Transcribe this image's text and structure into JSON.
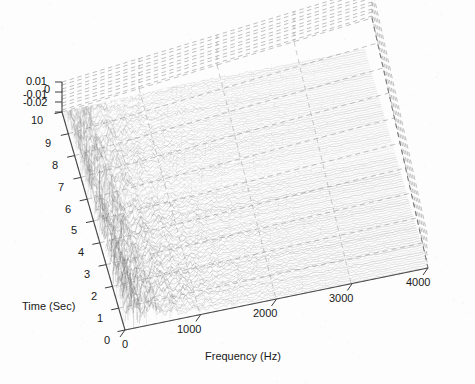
{
  "figure": {
    "type": "3d-waterfall-plot",
    "background": "#fdfdfd",
    "render_style": "scanned-fax-grayscale"
  },
  "axes": {
    "x": {
      "name": "frequency-axis",
      "title": "Frequency (Hz)",
      "ticks": [
        "0",
        "1000",
        "2000",
        "3000",
        "4000"
      ],
      "values": [
        0,
        1000,
        2000,
        3000,
        4000
      ],
      "range": [
        0,
        4000
      ]
    },
    "y": {
      "name": "time-axis",
      "title": "Time (Sec)",
      "ticks": [
        "0",
        "1",
        "2",
        "3",
        "4",
        "5",
        "6",
        "7",
        "8",
        "9",
        "10"
      ],
      "values": [
        0,
        1,
        2,
        3,
        4,
        5,
        6,
        7,
        8,
        9,
        10
      ],
      "range": [
        0,
        10
      ]
    },
    "z": {
      "name": "amplitude-axis",
      "title": "",
      "ticks": [
        "0.01",
        "0",
        "-0.01",
        "-0.02"
      ],
      "values": [
        0.01,
        0,
        -0.01,
        -0.02
      ],
      "range": [
        -0.02,
        0.01
      ]
    }
  },
  "chart_data": {
    "type": "line",
    "title": "",
    "subtitle": "",
    "xlabel": "Frequency (Hz)",
    "ylabel": "Time (Sec)",
    "zlabel": "",
    "xlim": [
      0,
      4000
    ],
    "ylim": [
      0,
      10
    ],
    "zlim": [
      -0.02,
      0.01
    ],
    "xticks": [
      0,
      1000,
      2000,
      3000,
      4000
    ],
    "yticks": [
      0,
      1,
      2,
      3,
      4,
      5,
      6,
      7,
      8,
      9,
      10
    ],
    "zticks": [
      -0.02,
      -0.01,
      0,
      0.01
    ],
    "grid": true,
    "grid_style": "dashed",
    "legend": null,
    "legend_position": "none",
    "projection": "3d-waterfall",
    "view": {
      "azimuth": -37,
      "elevation": 20
    },
    "n_traces": 100,
    "trace_axis": "time",
    "series": [
      {
        "name": "t=0.1",
        "time": 0.1,
        "peak_freq": 120,
        "peak_amp": 0.01
      },
      {
        "name": "t=1.0",
        "time": 1.0,
        "peak_freq": 150,
        "peak_amp": 0.009
      },
      {
        "name": "t=2.0",
        "time": 2.0,
        "peak_freq": 180,
        "peak_amp": 0.009
      },
      {
        "name": "t=3.0",
        "time": 3.0,
        "peak_freq": 200,
        "peak_amp": 0.008
      },
      {
        "name": "t=4.0",
        "time": 4.0,
        "peak_freq": 210,
        "peak_amp": 0.008
      },
      {
        "name": "t=5.0",
        "time": 5.0,
        "peak_freq": 230,
        "peak_amp": 0.007
      },
      {
        "name": "t=6.0",
        "time": 6.0,
        "peak_freq": 240,
        "peak_amp": 0.007
      },
      {
        "name": "t=7.0",
        "time": 7.0,
        "peak_freq": 260,
        "peak_amp": 0.006
      },
      {
        "name": "t=8.0",
        "time": 8.0,
        "peak_freq": 270,
        "peak_amp": 0.006
      },
      {
        "name": "t=9.0",
        "time": 9.0,
        "peak_freq": 290,
        "peak_amp": 0.005
      },
      {
        "name": "t=10.0",
        "time": 10.0,
        "peak_freq": 300,
        "peak_amp": 0.005
      }
    ],
    "frequency_bins": [
      0,
      200,
      400,
      600,
      800,
      1000,
      1200,
      1400,
      1600,
      1800,
      2000,
      2200,
      2400,
      2600,
      2800,
      3000,
      3200,
      3400,
      3600,
      3800,
      4000
    ],
    "mean_envelope": [
      0.01,
      0.0082,
      0.0058,
      0.0041,
      0.0031,
      0.0024,
      0.002,
      0.0017,
      0.0015,
      0.0013,
      0.0011,
      0.001,
      0.0009,
      0.0008,
      0.0007,
      0.0006,
      0.0006,
      0.0005,
      0.0005,
      0.0004,
      0.0004
    ]
  },
  "colors": {
    "axis_line": "#555555",
    "grid_line": "#9a9a9a",
    "trace": "#8a8a8a",
    "trace_dense": "#666666",
    "text": "#1a1a1a",
    "background": "#fdfdfd"
  }
}
